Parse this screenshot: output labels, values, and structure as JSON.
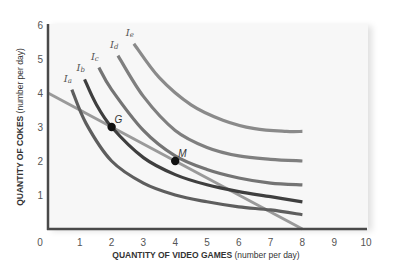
{
  "chart_data": {
    "type": "line",
    "title": "",
    "xlabel": "QUANTITY OF VIDEO GAMES",
    "xlabel_unit": "(number per day)",
    "ylabel": "QUANTITY OF COKES",
    "ylabel_unit": "(number per day)",
    "xlim": [
      0,
      10
    ],
    "ylim": [
      0,
      6
    ],
    "x_ticks": [
      "0",
      "1",
      "2",
      "3",
      "4",
      "5",
      "6",
      "7",
      "8",
      "9",
      "10"
    ],
    "y_ticks": [
      "1",
      "2",
      "3",
      "4",
      "5",
      "6"
    ],
    "grid": false,
    "series": [
      {
        "name": "Ia",
        "label_main": "I",
        "label_sub": "a",
        "kind": "indifference_curve",
        "color": "#5e5e5e",
        "x": [
          0.75,
          1.2,
          2.0,
          3.0,
          4.0,
          5.0,
          6.0,
          7.0,
          8.0
        ],
        "y": [
          4.1,
          3.1,
          2.0,
          1.35,
          1.0,
          0.8,
          0.65,
          0.56,
          0.42
        ]
      },
      {
        "name": "Ib",
        "label_main": "I",
        "label_sub": "b",
        "kind": "indifference_curve",
        "color": "#3f3f3f",
        "x": [
          1.15,
          1.5,
          2.0,
          3.0,
          4.0,
          5.0,
          6.0,
          7.0,
          8.0
        ],
        "y": [
          4.4,
          3.7,
          3.0,
          2.1,
          1.6,
          1.3,
          1.1,
          0.95,
          0.8
        ]
      },
      {
        "name": "Ic",
        "label_main": "I",
        "label_sub": "c",
        "kind": "indifference_curve",
        "color": "#747474",
        "x": [
          1.6,
          2.0,
          3.0,
          4.0,
          5.0,
          6.0,
          7.0,
          8.0
        ],
        "y": [
          4.75,
          4.1,
          2.9,
          2.15,
          1.75,
          1.5,
          1.35,
          1.3
        ]
      },
      {
        "name": "Id",
        "label_main": "I",
        "label_sub": "d",
        "kind": "indifference_curve",
        "color": "#7f7f7f",
        "x": [
          2.2,
          3.0,
          4.0,
          5.0,
          6.0,
          7.0,
          8.0
        ],
        "y": [
          5.1,
          3.9,
          2.9,
          2.4,
          2.15,
          2.05,
          2.0
        ]
      },
      {
        "name": "Ie",
        "label_main": "I",
        "label_sub": "e",
        "kind": "indifference_curve",
        "color": "#8a8a8a",
        "x": [
          2.7,
          3.5,
          4.5,
          5.5,
          6.5,
          7.5,
          8.0
        ],
        "y": [
          5.45,
          4.45,
          3.65,
          3.2,
          2.95,
          2.87,
          2.87
        ]
      },
      {
        "name": "Budget line",
        "kind": "budget_line",
        "color": "#9a9a9a",
        "x": [
          0,
          8
        ],
        "y": [
          4,
          0
        ]
      }
    ],
    "points": [
      {
        "label": "G",
        "x": 2,
        "y": 3
      },
      {
        "label": "M",
        "x": 4,
        "y": 2
      }
    ],
    "axis_color": "#4a4a4a",
    "plot_background": "#f7f7f7"
  }
}
